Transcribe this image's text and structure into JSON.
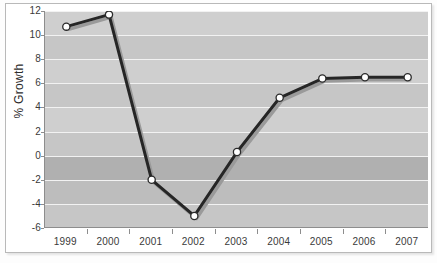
{
  "chart_data": {
    "type": "line",
    "title": "",
    "subtitle": "",
    "xlabel": "",
    "ylabel": "% Growth",
    "categories": [
      "1999",
      "2000",
      "2001",
      "2002",
      "2003",
      "2004",
      "2005",
      "2006",
      "2007"
    ],
    "x": [
      1999,
      2000,
      2001,
      2002,
      2003,
      2004,
      2005,
      2006,
      2007
    ],
    "series": [
      {
        "name": "% Growth",
        "values": [
          10.7,
          11.7,
          -2.0,
          -5.0,
          0.3,
          4.8,
          6.4,
          6.5,
          6.5
        ]
      }
    ],
    "values": [
      10.7,
      11.7,
      -2.0,
      -5.0,
      0.3,
      4.8,
      6.4,
      6.5,
      6.5
    ],
    "ylim": [
      -6,
      12
    ],
    "xlim": [
      "1999",
      "2007"
    ],
    "yticks": [
      12,
      10,
      8,
      6,
      4,
      2,
      0,
      -2,
      -4,
      -6
    ],
    "ytick_labels": [
      "12",
      "10",
      "8",
      "6",
      "4",
      "2",
      "0",
      "-2",
      "-4",
      "-6"
    ],
    "grid": true,
    "grid_orientation": "horizontal",
    "grid_color": "#f2f2f2",
    "legend": false,
    "legend_position": "none",
    "marker": "circle",
    "marker_face_color": "#ffffff",
    "marker_edge_color": "#2a2a2a",
    "line_color": "#262626",
    "shadow_color": "#9a9a9a",
    "plot_background": "#c9c9c9",
    "band_colors": [
      "#cfcfcf",
      "#c6c6c6",
      "#b0b0b0"
    ],
    "axis_color": "#8d8d8d",
    "text_color": "#3a3a3a",
    "figure_background": "#ffffff",
    "frame_color": "#b9b9b9"
  },
  "axes": {
    "y_label": "% Growth",
    "y_ticks": [
      "12",
      "10",
      "8",
      "6",
      "4",
      "2",
      "0",
      "-2",
      "-4",
      "-6"
    ],
    "x_ticks": [
      "1999",
      "2000",
      "2001",
      "2002",
      "2003",
      "2004",
      "2005",
      "2006",
      "2007"
    ]
  }
}
